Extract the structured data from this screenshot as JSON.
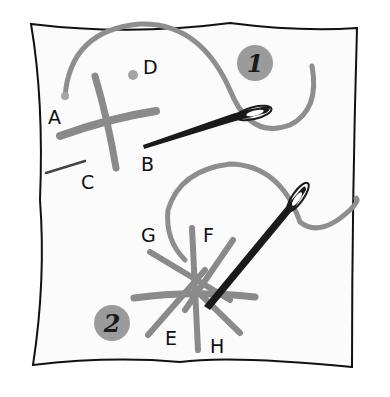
{
  "illustration": {
    "title": "Embroidery stitch diagram",
    "colors": {
      "fabric": "#fafafa",
      "outline": "#111111",
      "thread": "#8e8e8e",
      "needle": "#1a1a1a",
      "badge": "#9b9b9b"
    },
    "step1": {
      "badge": "1",
      "points": [
        {
          "label": "A",
          "x": 48,
          "y": 108
        },
        {
          "label": "D",
          "x": 143,
          "y": 58
        },
        {
          "label": "B",
          "x": 141,
          "y": 155
        },
        {
          "label": "C",
          "x": 81,
          "y": 173
        }
      ]
    },
    "step2": {
      "badge": "2",
      "points": [
        {
          "label": "G",
          "x": 141,
          "y": 226
        },
        {
          "label": "F",
          "x": 203,
          "y": 226
        },
        {
          "label": "E",
          "x": 165,
          "y": 329
        },
        {
          "label": "H",
          "x": 210,
          "y": 337
        }
      ]
    }
  }
}
